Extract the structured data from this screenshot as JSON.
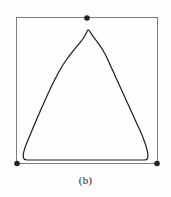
{
  "figure": {
    "caption": "(b)",
    "colors": {
      "background": "#fefefe",
      "bounding_box_stroke": "#7d7d7d",
      "curve_stroke": "#1c1c1c",
      "vertex_dot": "#232323",
      "caption_text": "#1d1d1d"
    },
    "bounding_box": {
      "name": "bounding-box",
      "x": 16.5,
      "y": 17.5,
      "width": 141,
      "height": 146,
      "stroke_width": 1
    },
    "vertex_dots": [
      {
        "name": "vertex-dot-top",
        "cx": 87,
        "cy": 18,
        "r": 2.8
      },
      {
        "name": "vertex-dot-bottom-left",
        "cx": 17,
        "cy": 163.5,
        "r": 2.8
      },
      {
        "name": "vertex-dot-bottom-right",
        "cx": 157,
        "cy": 163.5,
        "r": 2.8
      }
    ],
    "curve": {
      "name": "rounded-triangle-curve",
      "description": "jagged pixelated rounded-triangle outline",
      "stroke_width": 1.2,
      "apex": {
        "x": 87,
        "y": 30
      },
      "base_y": 160,
      "left_base_x": 27,
      "right_base_x": 148,
      "points": [
        [
          27.0,
          160.0
        ],
        [
          24.6,
          159.4
        ],
        [
          23.4,
          157.8
        ],
        [
          23.2,
          155.6
        ],
        [
          23.6,
          152.6
        ],
        [
          24.4,
          149.6
        ],
        [
          25.4,
          146.4
        ],
        [
          26.6,
          143.2
        ],
        [
          27.8,
          140.4
        ],
        [
          29.0,
          137.6
        ],
        [
          30.2,
          134.8
        ],
        [
          31.4,
          132.0
        ],
        [
          32.4,
          129.4
        ],
        [
          33.6,
          126.6
        ],
        [
          34.8,
          123.8
        ],
        [
          36.0,
          121.0
        ],
        [
          37.0,
          118.6
        ],
        [
          38.2,
          115.8
        ],
        [
          39.4,
          113.2
        ],
        [
          40.4,
          110.6
        ],
        [
          41.6,
          108.0
        ],
        [
          42.8,
          105.4
        ],
        [
          43.8,
          103.0
        ],
        [
          45.0,
          100.4
        ],
        [
          46.2,
          97.8
        ],
        [
          47.2,
          95.4
        ],
        [
          48.4,
          92.8
        ],
        [
          49.6,
          90.4
        ],
        [
          50.6,
          88.0
        ],
        [
          51.8,
          85.6
        ],
        [
          53.0,
          83.2
        ],
        [
          54.2,
          80.8
        ],
        [
          55.4,
          78.4
        ],
        [
          56.6,
          76.2
        ],
        [
          57.8,
          73.8
        ],
        [
          59.0,
          71.6
        ],
        [
          60.4,
          69.4
        ],
        [
          61.6,
          67.2
        ],
        [
          62.8,
          65.2
        ],
        [
          64.2,
          63.0
        ],
        [
          65.6,
          61.0
        ],
        [
          67.0,
          59.0
        ],
        [
          68.4,
          57.2
        ],
        [
          69.8,
          55.2
        ],
        [
          71.2,
          53.4
        ],
        [
          72.6,
          51.6
        ],
        [
          74.0,
          49.8
        ],
        [
          75.4,
          48.2
        ],
        [
          76.8,
          46.4
        ],
        [
          78.2,
          44.8
        ],
        [
          79.6,
          43.2
        ],
        [
          80.8,
          41.6
        ],
        [
          82.0,
          40.0
        ],
        [
          83.2,
          38.4
        ],
        [
          84.2,
          36.8
        ],
        [
          85.2,
          35.2
        ],
        [
          86.0,
          33.6
        ],
        [
          86.8,
          32.0
        ],
        [
          87.4,
          30.6
        ],
        [
          88.2,
          30.0
        ],
        [
          89.2,
          30.6
        ],
        [
          90.2,
          32.0
        ],
        [
          91.2,
          33.6
        ],
        [
          92.2,
          35.2
        ],
        [
          93.4,
          36.8
        ],
        [
          94.6,
          38.4
        ],
        [
          95.8,
          40.0
        ],
        [
          97.0,
          41.6
        ],
        [
          98.2,
          43.2
        ],
        [
          99.4,
          44.8
        ],
        [
          100.6,
          46.6
        ],
        [
          101.8,
          48.4
        ],
        [
          103.0,
          50.2
        ],
        [
          104.0,
          52.2
        ],
        [
          105.2,
          54.2
        ],
        [
          106.2,
          56.2
        ],
        [
          107.2,
          58.4
        ],
        [
          108.2,
          60.6
        ],
        [
          109.2,
          62.8
        ],
        [
          110.2,
          65.0
        ],
        [
          111.2,
          67.2
        ],
        [
          112.2,
          69.4
        ],
        [
          113.2,
          71.6
        ],
        [
          114.2,
          73.8
        ],
        [
          115.2,
          76.0
        ],
        [
          116.2,
          78.2
        ],
        [
          117.2,
          80.4
        ],
        [
          118.2,
          82.6
        ],
        [
          119.2,
          84.8
        ],
        [
          120.2,
          87.0
        ],
        [
          121.2,
          89.2
        ],
        [
          122.2,
          91.4
        ],
        [
          123.2,
          93.6
        ],
        [
          124.2,
          95.8
        ],
        [
          125.2,
          98.0
        ],
        [
          126.2,
          100.2
        ],
        [
          127.2,
          102.4
        ],
        [
          128.2,
          104.6
        ],
        [
          129.2,
          106.8
        ],
        [
          130.2,
          109.0
        ],
        [
          131.2,
          111.2
        ],
        [
          132.2,
          113.4
        ],
        [
          133.2,
          115.6
        ],
        [
          134.2,
          117.8
        ],
        [
          135.2,
          120.0
        ],
        [
          136.2,
          122.2
        ],
        [
          137.2,
          124.4
        ],
        [
          138.2,
          126.6
        ],
        [
          139.2,
          128.8
        ],
        [
          140.2,
          131.0
        ],
        [
          141.2,
          133.2
        ],
        [
          142.2,
          135.4
        ],
        [
          143.0,
          137.6
        ],
        [
          143.8,
          139.8
        ],
        [
          144.6,
          142.0
        ],
        [
          145.4,
          144.2
        ],
        [
          146.2,
          146.6
        ],
        [
          146.8,
          149.0
        ],
        [
          147.4,
          151.4
        ],
        [
          147.8,
          153.8
        ],
        [
          148.0,
          156.0
        ],
        [
          147.6,
          158.2
        ],
        [
          146.4,
          159.6
        ],
        [
          144.2,
          160.0
        ],
        [
          27.0,
          160.0
        ]
      ]
    }
  }
}
